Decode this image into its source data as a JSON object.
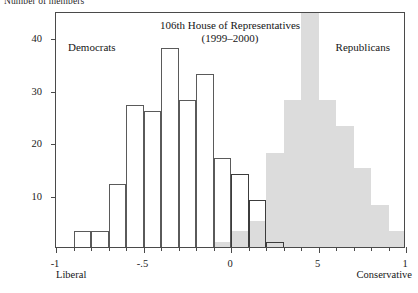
{
  "ylabel": "Number of members",
  "annotations": {
    "title": "106th House of Representatives\n(1999–2000)",
    "group_left": "Democrats",
    "group_right": "Republicans",
    "end_left": "Liberal",
    "end_right": "Conservative"
  },
  "colors": {
    "republican_fill": "#dcdcdc",
    "democrat_stroke": "#5a5a5a",
    "axis": "#4a4a4a",
    "text": "#161616",
    "background": "#ffffff"
  },
  "chart_data": {
    "type": "bar",
    "title": "106th House of Representatives (1999–2000)",
    "subtitle": "(1999–2000)",
    "xlabel": "",
    "ylabel": "Number of members",
    "xlim": [
      -1,
      1
    ],
    "ylim": [
      0,
      45
    ],
    "grid": false,
    "legend_position": "in-plot-annotations",
    "bin_width": 0.1,
    "xticks": [
      -1,
      -0.5,
      0,
      0.5,
      1
    ],
    "xtick_labels": [
      "-1",
      "-.5",
      "0",
      "5",
      "1"
    ],
    "yticks": [
      10,
      20,
      30,
      40
    ],
    "ytick_labels": [
      "10",
      "20",
      "30",
      "40"
    ],
    "axis_end_labels": {
      "left": "Liberal",
      "right": "Conservative"
    },
    "series": [
      {
        "name": "Democrats",
        "style": "outlined-white",
        "bin_centers": [
          -0.85,
          -0.75,
          -0.65,
          -0.55,
          -0.45,
          -0.35,
          -0.25,
          -0.15,
          -0.05,
          0.05,
          0.15,
          0.25,
          0.35,
          0.45,
          0.55
        ],
        "values": [
          3,
          3,
          12,
          27,
          26,
          38,
          28,
          33,
          17,
          14,
          9,
          1,
          0,
          0,
          0
        ]
      },
      {
        "name": "Republicans",
        "style": "filled-gray",
        "bin_centers": [
          -0.05,
          0.05,
          0.15,
          0.25,
          0.35,
          0.45,
          0.55,
          0.65,
          0.75,
          0.85,
          0.95
        ],
        "values": [
          1,
          3,
          5,
          18,
          28,
          45,
          28,
          23,
          15,
          8,
          3
        ]
      }
    ]
  }
}
